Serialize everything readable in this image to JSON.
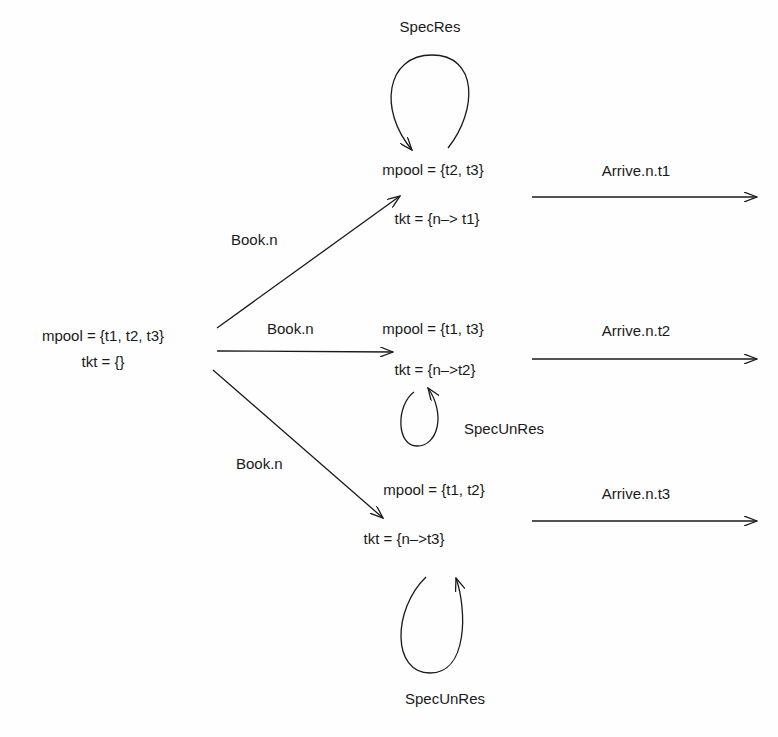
{
  "diagram": {
    "type": "state-transition",
    "initial_state": {
      "mpool": "mpool = {t1, t2, t3}",
      "tkt": "tkt = {}"
    },
    "states": [
      {
        "id": "s1",
        "mpool": "mpool = {t2, t3}",
        "tkt": "tkt = {n–> t1}",
        "self_loop": "SpecRes",
        "exit": "Arrive.n.t1"
      },
      {
        "id": "s2",
        "mpool": "mpool = {t1, t3}",
        "tkt": "tkt = {n–>t2}",
        "self_loop": "SpecUnRes",
        "exit": "Arrive.n.t2"
      },
      {
        "id": "s3",
        "mpool": "mpool = {t1, t2}",
        "tkt": "tkt = {n–>t3}",
        "self_loop": "SpecUnRes",
        "exit": "Arrive.n.t3"
      }
    ],
    "transitions": [
      {
        "from": "initial",
        "to": "s1",
        "label": "Book.n"
      },
      {
        "from": "initial",
        "to": "s2",
        "label": "Book.n"
      },
      {
        "from": "initial",
        "to": "s3",
        "label": "Book.n"
      }
    ],
    "colors": {
      "ink": "#1a1a1a",
      "background": "#fefefe"
    }
  }
}
